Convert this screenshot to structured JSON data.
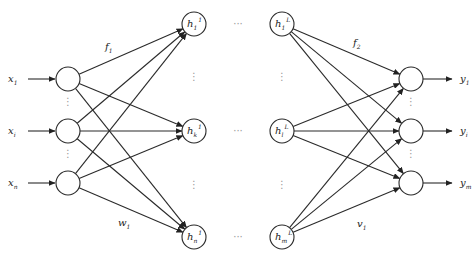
{
  "diagram": {
    "type": "feedforward-neural-network",
    "inputs": [
      {
        "base": "x",
        "sub": "1",
        "y": 79
      },
      {
        "base": "x",
        "sub": "i",
        "y": 131
      },
      {
        "base": "x",
        "sub": "n",
        "y": 183
      }
    ],
    "hidden_first": [
      {
        "base": "h",
        "sub": "1",
        "sup": "1",
        "y": 24
      },
      {
        "base": "h",
        "sub": "k",
        "sup": "1",
        "y": 131
      },
      {
        "base": "h",
        "sub": "n",
        "sup": "1",
        "y": 237
      }
    ],
    "hidden_last": [
      {
        "base": "h",
        "sub": "1",
        "sup": "L",
        "y": 24
      },
      {
        "base": "h",
        "sub": "l",
        "sup": "L",
        "y": 131
      },
      {
        "base": "h",
        "sub": "m",
        "sup": "L",
        "y": 237
      }
    ],
    "outputs": [
      {
        "base": "y",
        "sub": "1",
        "y": 79
      },
      {
        "base": "y",
        "sub": "i",
        "y": 131
      },
      {
        "base": "y",
        "sub": "m",
        "y": 183
      }
    ],
    "edge_labels": {
      "f1": {
        "base": "f",
        "sub": "1"
      },
      "w1": {
        "base": "w",
        "sub": "1"
      },
      "f2": {
        "base": "f",
        "sub": "2"
      },
      "v1": {
        "base": "v",
        "sub": "1"
      }
    },
    "ellipsis_horizontal": "···",
    "ellipsis_vertical": "⋮"
  }
}
